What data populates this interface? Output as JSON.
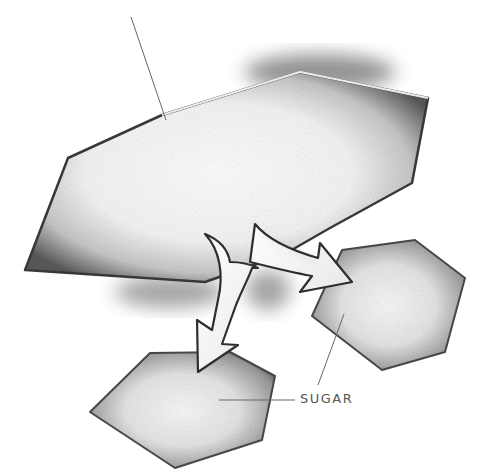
{
  "diagram": {
    "labels": {
      "sugar": "SUGAR"
    },
    "colors": {
      "background": "#ffffff",
      "shape_fill": "#f4f4f4",
      "shape_shade": "#2a2a2a",
      "leader_line": "#666666",
      "label_text": "#555555"
    },
    "nodes": [
      {
        "id": "large-molecule",
        "shape": "hexagon",
        "role": "source"
      },
      {
        "id": "small-molecule-right",
        "shape": "hexagon",
        "role": "product"
      },
      {
        "id": "small-molecule-bottom",
        "shape": "hexagon",
        "role": "product",
        "label": "SUGAR"
      }
    ],
    "arrows": [
      {
        "from": "large-molecule",
        "to": "small-molecule-right"
      },
      {
        "from": "large-molecule",
        "to": "small-molecule-bottom"
      }
    ]
  }
}
